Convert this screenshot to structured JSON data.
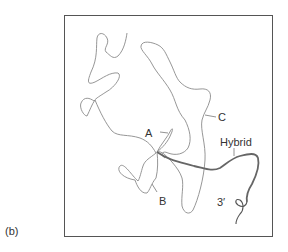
{
  "figure": {
    "panel_label": "(b)",
    "labels": {
      "a": "A",
      "b": "B",
      "c": "C",
      "hybrid": "Hybrid",
      "three_prime": "3′"
    },
    "colors": {
      "thin_strand": "#8a8a8a",
      "hybrid_strand": "#666666",
      "frame": "#555555",
      "text": "#333333"
    }
  }
}
